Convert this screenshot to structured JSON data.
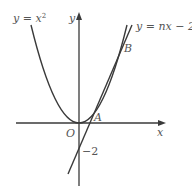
{
  "figure": {
    "curve_label": "y = x²",
    "curve_label_base": "y = x",
    "curve_label_exp": "2",
    "line_label": "y = nx − 2",
    "y_axis_label": "y",
    "x_axis_label": "x",
    "origin_label": "O",
    "point_a_label": "A",
    "point_b_label": "B",
    "intercept_label": "−2",
    "stroke_color": "#3a3a3a",
    "text_color": "#555555"
  }
}
